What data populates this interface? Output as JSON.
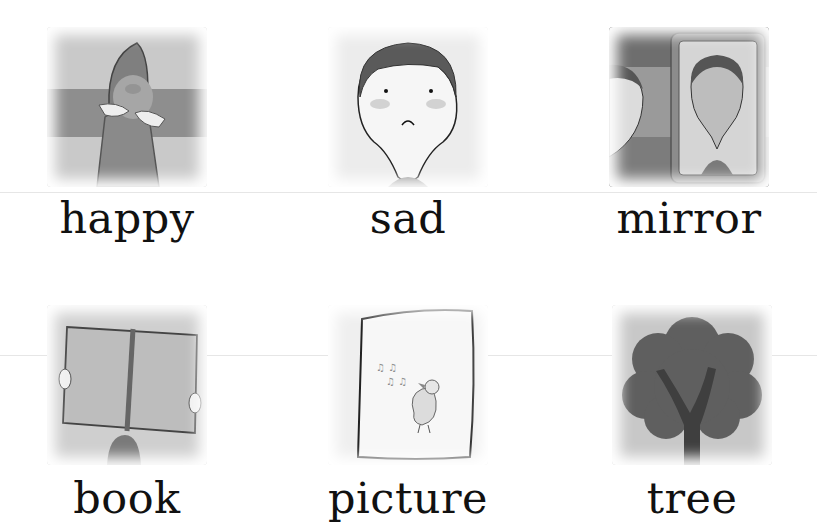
{
  "worksheet": {
    "cards": [
      {
        "word": "happy",
        "picture": "happy-child-illustration"
      },
      {
        "word": "sad",
        "picture": "sad-boy-illustration"
      },
      {
        "word": "mirror",
        "picture": "boy-in-mirror-illustration"
      },
      {
        "word": "book",
        "picture": "child-reading-book-illustration"
      },
      {
        "word": "picture",
        "picture": "framed-singing-bird-illustration"
      },
      {
        "word": "tree",
        "picture": "tree-illustration"
      }
    ]
  }
}
